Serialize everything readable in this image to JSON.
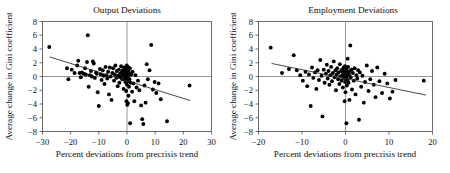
{
  "figure": {
    "panel_count": 2,
    "background": "#ffffff",
    "point_color": "#000000",
    "line_color": "#2a2a2a"
  },
  "chart_data": [
    {
      "type": "scatter",
      "title": "Output Deviations",
      "xlabel": "Percent deviations from precrisis trend",
      "ylabel": "Average change in Gini coefficient",
      "xlim": [
        -30,
        30
      ],
      "ylim": [
        -8,
        8
      ],
      "xticks": [
        -30,
        -20,
        -10,
        0,
        10,
        20,
        30
      ],
      "yticks": [
        8,
        6,
        4,
        2,
        0,
        -2,
        -4,
        -6,
        -8
      ],
      "grid": false,
      "legend": "none",
      "reference_lines": [
        {
          "orientation": "horizontal",
          "value": 0
        },
        {
          "orientation": "vertical",
          "value": 0
        }
      ],
      "fit_line": {
        "x": [
          -27.5,
          22.5
        ],
        "y": [
          2.85,
          -3.5
        ],
        "slope": -0.127,
        "intercept": -0.64
      },
      "points": [
        [
          -27.6,
          4.3
        ],
        [
          -21.3,
          1.2
        ],
        [
          -20.8,
          -0.4
        ],
        [
          -19.6,
          1.0
        ],
        [
          -18.6,
          0.5
        ],
        [
          -17.7,
          1.6
        ],
        [
          -17.3,
          2.3
        ],
        [
          -16.8,
          0.5
        ],
        [
          -16.4,
          -0.1
        ],
        [
          -16.0,
          0.6
        ],
        [
          -15.4,
          0.4
        ],
        [
          -14.9,
          1.2
        ],
        [
          -14.6,
          0.3
        ],
        [
          -14.2,
          2.1
        ],
        [
          -13.9,
          6.0
        ],
        [
          -13.6,
          -1.5
        ],
        [
          -13.2,
          0.2
        ],
        [
          -12.8,
          0.8
        ],
        [
          -12.5,
          0.0
        ],
        [
          -12.1,
          2.2
        ],
        [
          -11.8,
          1.9
        ],
        [
          -11.4,
          -0.2
        ],
        [
          -11.0,
          0.6
        ],
        [
          -10.7,
          0.4
        ],
        [
          -10.4,
          -2.3
        ],
        [
          -10.0,
          -4.3
        ],
        [
          -9.6,
          1.1
        ],
        [
          -9.3,
          0.3
        ],
        [
          -9.0,
          -0.5
        ],
        [
          -8.6,
          0.9
        ],
        [
          -8.3,
          0.1
        ],
        [
          -8.0,
          -1.1
        ],
        [
          -7.6,
          1.4
        ],
        [
          -7.3,
          0.2
        ],
        [
          -7.0,
          -0.3
        ],
        [
          -6.7,
          0.7
        ],
        [
          -6.4,
          -2.6
        ],
        [
          -6.1,
          1.3
        ],
        [
          -5.8,
          0.0
        ],
        [
          -5.5,
          -3.4
        ],
        [
          -5.2,
          0.5
        ],
        [
          -4.9,
          1.2
        ],
        [
          -4.6,
          -0.6
        ],
        [
          -4.3,
          0.3
        ],
        [
          -4.1,
          1.6
        ],
        [
          -3.8,
          -0.2
        ],
        [
          -3.6,
          0.8
        ],
        [
          -3.3,
          -1.4
        ],
        [
          -3.1,
          0.1
        ],
        [
          -2.9,
          1.0
        ],
        [
          -2.7,
          -0.9
        ],
        [
          -2.5,
          0.4
        ],
        [
          -2.3,
          -0.1
        ],
        [
          -2.1,
          1.5
        ],
        [
          -1.9,
          0.6
        ],
        [
          -1.7,
          -0.4
        ],
        [
          -1.5,
          0.9
        ],
        [
          -1.4,
          0.2
        ],
        [
          -1.2,
          -1.8
        ],
        [
          -1.1,
          0.7
        ],
        [
          -0.9,
          1.3
        ],
        [
          -0.8,
          -0.3
        ],
        [
          -0.7,
          0.5
        ],
        [
          -0.6,
          -0.8
        ],
        [
          -0.5,
          1.1
        ],
        [
          -0.4,
          0.0
        ],
        [
          -0.3,
          -2.1
        ],
        [
          -0.2,
          0.8
        ],
        [
          -0.2,
          -3.6
        ],
        [
          -0.1,
          1.6
        ],
        [
          -0.1,
          -0.5
        ],
        [
          0.0,
          0.3
        ],
        [
          0.0,
          -1.2
        ],
        [
          0.1,
          1.0
        ],
        [
          0.1,
          -4.1
        ],
        [
          0.2,
          0.6
        ],
        [
          0.2,
          -0.2
        ],
        [
          0.3,
          1.4
        ],
        [
          0.3,
          -3.9
        ],
        [
          0.4,
          -0.7
        ],
        [
          0.5,
          0.9
        ],
        [
          0.5,
          -2.8
        ],
        [
          0.6,
          0.1
        ],
        [
          0.7,
          -1.5
        ],
        [
          0.8,
          0.5
        ],
        [
          0.9,
          -0.4
        ],
        [
          1.0,
          1.2
        ],
        [
          1.1,
          -6.8
        ],
        [
          1.3,
          -0.9
        ],
        [
          1.5,
          0.3
        ],
        [
          1.8,
          -2.2
        ],
        [
          2.0,
          0.7
        ],
        [
          2.3,
          -1.0
        ],
        [
          2.6,
          -3.6
        ],
        [
          3.0,
          0.2
        ],
        [
          3.4,
          -1.6
        ],
        [
          3.9,
          -0.6
        ],
        [
          4.4,
          -2.0
        ],
        [
          5.0,
          -4.2
        ],
        [
          5.4,
          -6.2
        ],
        [
          5.8,
          -6.9
        ],
        [
          6.2,
          -1.3
        ],
        [
          6.6,
          -3.8
        ],
        [
          7.0,
          1.8
        ],
        [
          7.4,
          -0.4
        ],
        [
          8.0,
          0.9
        ],
        [
          8.6,
          4.6
        ],
        [
          9.2,
          -1.9
        ],
        [
          9.8,
          -0.8
        ],
        [
          10.4,
          -2.4
        ],
        [
          11.2,
          -1.0
        ],
        [
          12.0,
          -3.3
        ],
        [
          14.2,
          -6.5
        ],
        [
          22.2,
          -1.3
        ]
      ]
    },
    {
      "type": "scatter",
      "title": "Employment Deviations",
      "xlabel": "Percent deviations from precrisis trend",
      "ylabel": "Average change in Gini coefficient",
      "xlim": [
        -20,
        20
      ],
      "ylim": [
        -8,
        8
      ],
      "xticks": [
        -20,
        -10,
        0,
        10,
        20
      ],
      "yticks": [
        8,
        6,
        4,
        2,
        0,
        -2,
        -4,
        -6,
        -8
      ],
      "grid": false,
      "legend": "none",
      "reference_lines": [
        {
          "orientation": "horizontal",
          "value": 0
        },
        {
          "orientation": "vertical",
          "value": 0
        }
      ],
      "fit_line": {
        "x": [
          -17.0,
          18.5
        ],
        "y": [
          1.9,
          -2.7
        ],
        "slope": -0.13,
        "intercept": -0.31
      },
      "points": [
        [
          -17.2,
          4.2
        ],
        [
          -14.6,
          0.5
        ],
        [
          -13.0,
          1.1
        ],
        [
          -11.9,
          3.1
        ],
        [
          -11.2,
          0.9
        ],
        [
          -10.4,
          0.2
        ],
        [
          -9.8,
          -0.6
        ],
        [
          -9.2,
          0.7
        ],
        [
          -8.8,
          -1.4
        ],
        [
          -8.4,
          0.3
        ],
        [
          -8.0,
          -4.3
        ],
        [
          -7.7,
          1.3
        ],
        [
          -7.4,
          -0.2
        ],
        [
          -7.0,
          0.6
        ],
        [
          -6.7,
          -1.8
        ],
        [
          -6.4,
          0.9
        ],
        [
          -6.1,
          -0.5
        ],
        [
          -5.8,
          2.4
        ],
        [
          -5.5,
          0.1
        ],
        [
          -5.3,
          -5.8
        ],
        [
          -5.0,
          1.0
        ],
        [
          -4.8,
          -0.9
        ],
        [
          -4.5,
          0.4
        ],
        [
          -4.3,
          1.7
        ],
        [
          -4.1,
          -0.3
        ],
        [
          -3.9,
          0.8
        ],
        [
          -3.7,
          -1.2
        ],
        [
          -3.5,
          0.2
        ],
        [
          -3.3,
          1.4
        ],
        [
          -3.1,
          -0.7
        ],
        [
          -2.9,
          0.5
        ],
        [
          -2.7,
          2.2
        ],
        [
          -2.5,
          -0.1
        ],
        [
          -2.3,
          0.9
        ],
        [
          -2.2,
          -2.0
        ],
        [
          -2.0,
          0.3
        ],
        [
          -1.9,
          1.2
        ],
        [
          -1.7,
          -0.4
        ],
        [
          -1.6,
          0.6
        ],
        [
          -1.4,
          -1.1
        ],
        [
          -1.3,
          1.8
        ],
        [
          -1.2,
          0.0
        ],
        [
          -1.0,
          0.8
        ],
        [
          -0.9,
          -0.6
        ],
        [
          -0.8,
          1.0
        ],
        [
          -0.7,
          0.2
        ],
        [
          -0.6,
          -1.6
        ],
        [
          -0.5,
          0.5
        ],
        [
          -0.4,
          1.3
        ],
        [
          -0.4,
          -0.2
        ],
        [
          -0.3,
          0.7
        ],
        [
          -0.2,
          -3.6
        ],
        [
          -0.2,
          0.1
        ],
        [
          -0.1,
          1.5
        ],
        [
          -0.1,
          -0.8
        ],
        [
          0.0,
          0.4
        ],
        [
          0.0,
          -2.3
        ],
        [
          0.1,
          0.9
        ],
        [
          0.1,
          -0.3
        ],
        [
          0.2,
          1.1
        ],
        [
          0.2,
          -6.8
        ],
        [
          0.3,
          0.0
        ],
        [
          0.3,
          -1.3
        ],
        [
          0.4,
          0.6
        ],
        [
          0.5,
          2.6
        ],
        [
          0.5,
          -0.5
        ],
        [
          0.6,
          1.4
        ],
        [
          0.7,
          -0.9
        ],
        [
          0.8,
          0.3
        ],
        [
          0.9,
          -3.4
        ],
        [
          1.0,
          0.8
        ],
        [
          1.1,
          4.5
        ],
        [
          1.2,
          -0.1
        ],
        [
          1.4,
          1.0
        ],
        [
          1.5,
          -1.9
        ],
        [
          1.7,
          0.5
        ],
        [
          1.9,
          -0.6
        ],
        [
          2.1,
          1.2
        ],
        [
          2.3,
          -2.6
        ],
        [
          2.5,
          0.2
        ],
        [
          2.7,
          -0.3
        ],
        [
          2.9,
          0.9
        ],
        [
          3.1,
          -6.3
        ],
        [
          3.3,
          0.6
        ],
        [
          3.6,
          -1.5
        ],
        [
          3.9,
          0.1
        ],
        [
          4.2,
          -3.8
        ],
        [
          4.5,
          -0.8
        ],
        [
          4.9,
          1.6
        ],
        [
          5.3,
          -2.1
        ],
        [
          5.7,
          -0.4
        ],
        [
          6.1,
          0.8
        ],
        [
          6.5,
          -1.2
        ],
        [
          6.9,
          -3.0
        ],
        [
          7.3,
          1.3
        ],
        [
          7.8,
          -0.7
        ],
        [
          8.4,
          -2.4
        ],
        [
          9.0,
          0.4
        ],
        [
          9.6,
          -1.0
        ],
        [
          10.2,
          -3.2
        ],
        [
          10.8,
          -2.2
        ],
        [
          11.5,
          -0.5
        ],
        [
          18.0,
          -0.6
        ]
      ]
    }
  ]
}
